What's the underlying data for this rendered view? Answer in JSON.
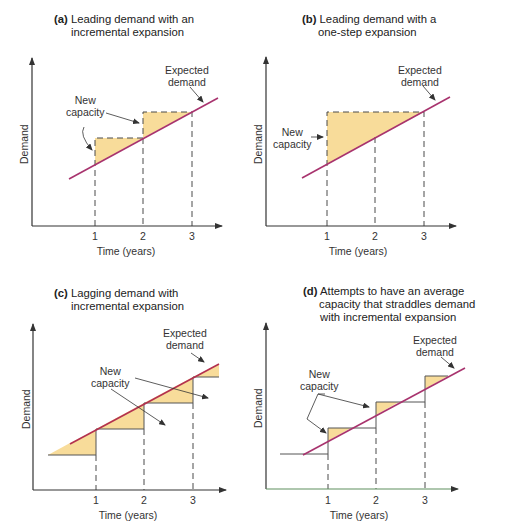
{
  "colors": {
    "demand_line": "#a8336e",
    "capacity_fill": "#f8dc9a",
    "axis": "#3a3a3a",
    "axis_green": "#5f8f5f",
    "dashes": "#4a4a4a"
  },
  "panels": [
    {
      "id": "a",
      "letter": "(a)",
      "title_line1": "Leading demand with an",
      "title_line2": "incremental expansion",
      "new_capacity_label_1": "New",
      "new_capacity_label_2": "capacity",
      "expected_demand_label_1": "Expected",
      "expected_demand_label_2": "demand",
      "y_axis_label": "Demand",
      "x_axis_label": "Time (years)",
      "ticks": [
        "1",
        "2",
        "3"
      ]
    },
    {
      "id": "b",
      "letter": "(b)",
      "title_line1": "Leading demand with a",
      "title_line2": "one-step expansion",
      "new_capacity_label_1": "New",
      "new_capacity_label_2": "capacity",
      "expected_demand_label_1": "Expected",
      "expected_demand_label_2": "demand",
      "y_axis_label": "Demand",
      "x_axis_label": "Time (years)",
      "ticks": [
        "1",
        "2",
        "3"
      ]
    },
    {
      "id": "c",
      "letter": "(c)",
      "title_line1": "Lagging demand with",
      "title_line2": "incremental expansion",
      "new_capacity_label_1": "New",
      "new_capacity_label_2": "capacity",
      "expected_demand_label_1": "Expected",
      "expected_demand_label_2": "demand",
      "y_axis_label": "Demand",
      "x_axis_label": "Time (years)",
      "ticks": [
        "1",
        "2",
        "3"
      ]
    },
    {
      "id": "d",
      "letter": "(d)",
      "title_line1": "Attempts to have an average",
      "title_line2": "capacity that straddles demand",
      "title_line3": "with incremental expansion",
      "new_capacity_label_1": "New",
      "new_capacity_label_2": "capacity",
      "expected_demand_label_1": "Expected",
      "expected_demand_label_2": "demand",
      "y_axis_label": "Demand",
      "x_axis_label": "Time (years)",
      "ticks": [
        "1",
        "2",
        "3"
      ]
    }
  ]
}
